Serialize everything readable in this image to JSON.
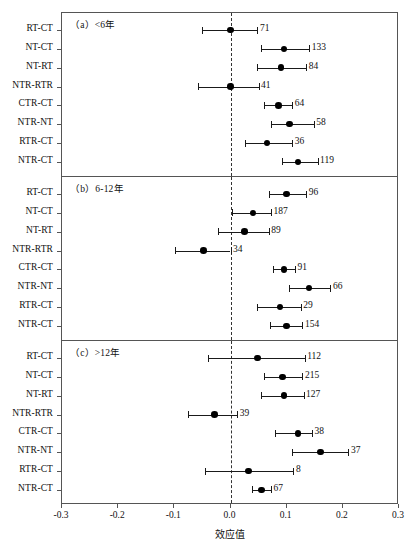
{
  "chart_data": {
    "type": "scatter",
    "title": "",
    "xlabel": "效应值",
    "ylabel": "",
    "xlim": [
      -0.3,
      0.3
    ],
    "xticks": [
      -0.3,
      -0.2,
      -0.1,
      0.0,
      0.1,
      0.2,
      0.3
    ],
    "xticklabels": [
      "-0.3",
      "-0.2",
      "-0.1",
      "0.0",
      "0.1",
      "0.2",
      "0.3"
    ],
    "grid": false,
    "legend": null,
    "reference_line": 0.0,
    "annotation_note": "Number beside each interval is the sample/effect count (k)",
    "panels": [
      {
        "label": "（a）<6年",
        "rows": [
          {
            "category": "RT-CT",
            "value": 0.0,
            "ci_low": -0.05,
            "ci_high": 0.048,
            "n": "71"
          },
          {
            "category": "NT-CT",
            "value": 0.095,
            "ci_low": 0.055,
            "ci_high": 0.14,
            "n": "133"
          },
          {
            "category": "NT-RT",
            "value": 0.09,
            "ci_low": 0.048,
            "ci_high": 0.135,
            "n": "84"
          },
          {
            "category": "NTR-RTR",
            "value": 0.0,
            "ci_low": -0.058,
            "ci_high": 0.05,
            "n": "41"
          },
          {
            "category": "CTR-CT",
            "value": 0.085,
            "ci_low": 0.06,
            "ci_high": 0.11,
            "n": "64"
          },
          {
            "category": "NTR-NT",
            "value": 0.105,
            "ci_low": 0.072,
            "ci_high": 0.148,
            "n": "58"
          },
          {
            "category": "RTR-CT",
            "value": 0.065,
            "ci_low": 0.025,
            "ci_high": 0.11,
            "n": "36"
          },
          {
            "category": "NTR-CT",
            "value": 0.12,
            "ci_low": 0.092,
            "ci_high": 0.155,
            "n": "119"
          }
        ]
      },
      {
        "label": "（b）6-12年",
        "rows": [
          {
            "category": "RT-CT",
            "value": 0.1,
            "ci_low": 0.068,
            "ci_high": 0.135,
            "n": "96"
          },
          {
            "category": "NT-CT",
            "value": 0.04,
            "ci_low": 0.003,
            "ci_high": 0.072,
            "n": "187"
          },
          {
            "category": "NT-RT",
            "value": 0.025,
            "ci_low": -0.022,
            "ci_high": 0.068,
            "n": "89"
          },
          {
            "category": "NTR-RTR",
            "value": -0.048,
            "ci_low": -0.098,
            "ci_high": 0.0,
            "n": "34"
          },
          {
            "category": "CTR-CT",
            "value": 0.095,
            "ci_low": 0.075,
            "ci_high": 0.115,
            "n": "91"
          },
          {
            "category": "NTR-NT",
            "value": 0.14,
            "ci_low": 0.105,
            "ci_high": 0.178,
            "n": "66"
          },
          {
            "category": "RTR-CT",
            "value": 0.088,
            "ci_low": 0.048,
            "ci_high": 0.125,
            "n": "29"
          },
          {
            "category": "NTR-CT",
            "value": 0.1,
            "ci_low": 0.07,
            "ci_high": 0.128,
            "n": "154"
          }
        ]
      },
      {
        "label": "（c）>12年",
        "rows": [
          {
            "category": "RT-CT",
            "value": 0.048,
            "ci_low": -0.04,
            "ci_high": 0.132,
            "n": "112"
          },
          {
            "category": "NT-CT",
            "value": 0.093,
            "ci_low": 0.06,
            "ci_high": 0.128,
            "n": "215"
          },
          {
            "category": "NT-RT",
            "value": 0.095,
            "ci_low": 0.055,
            "ci_high": 0.13,
            "n": "127"
          },
          {
            "category": "NTR-RTR",
            "value": -0.028,
            "ci_low": -0.075,
            "ci_high": 0.012,
            "n": "39"
          },
          {
            "category": "CTR-CT",
            "value": 0.12,
            "ci_low": 0.08,
            "ci_high": 0.145,
            "n": "38"
          },
          {
            "category": "NTR-NT",
            "value": 0.16,
            "ci_low": 0.11,
            "ci_high": 0.21,
            "n": "37"
          },
          {
            "category": "RTR-CT",
            "value": 0.032,
            "ci_low": -0.045,
            "ci_high": 0.112,
            "n": "8"
          },
          {
            "category": "NTR-CT",
            "value": 0.055,
            "ci_low": 0.038,
            "ci_high": 0.072,
            "n": "67"
          }
        ]
      }
    ]
  }
}
